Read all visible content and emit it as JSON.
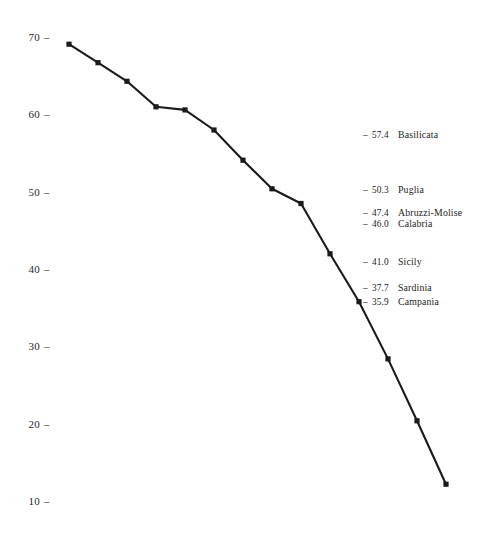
{
  "chart_data": {
    "type": "line",
    "title": "",
    "xlabel": "",
    "ylabel": "",
    "ylim": [
      10,
      70
    ],
    "xlim": [
      0,
      13
    ],
    "grid": false,
    "legend_position": "none",
    "y_ticks": [
      70,
      60,
      50,
      40,
      30,
      20,
      10
    ],
    "y_tick_labels": [
      "70",
      "60",
      "50",
      "40",
      "30",
      "20",
      "10"
    ],
    "x_ticks": [],
    "x_tick_labels": [],
    "marker": "square",
    "line_color": "#1a1a1a",
    "marker_color": "#1a1a1a",
    "x": [
      0,
      1,
      2,
      3,
      4,
      5,
      6,
      7,
      8,
      9,
      10,
      11,
      12,
      13
    ],
    "values": [
      69.2,
      66.8,
      64.4,
      61.1,
      60.7,
      58.1,
      54.2,
      50.5,
      48.6,
      42.1,
      35.9,
      28.5,
      20.5,
      12.3
    ],
    "series": [
      {
        "name": "regions",
        "values": [
          69.2,
          66.8,
          64.4,
          61.1,
          60.7,
          58.1,
          54.2,
          50.5,
          48.6,
          42.1,
          35.9,
          28.5,
          20.5,
          12.3
        ]
      }
    ],
    "points_px": [
      [
        69,
        40
      ],
      [
        103,
        59
      ],
      [
        132,
        77
      ],
      [
        165,
        103
      ],
      [
        196,
        107
      ],
      [
        228,
        127
      ],
      [
        258,
        158
      ],
      [
        292,
        187
      ],
      [
        320,
        202
      ],
      [
        348,
        252
      ],
      [
        380,
        362
      ],
      [
        409,
        362
      ],
      [
        414,
        424
      ],
      [
        446,
        488
      ]
    ],
    "annotations": [
      {
        "value": "57.4",
        "label": "Basilicata",
        "dash": "–"
      },
      {
        "value": "50.3",
        "label": "Puglia",
        "dash": "–"
      },
      {
        "value": "47.4",
        "label": "Abruzzi-Molise",
        "dash": "–"
      },
      {
        "value": "46.0",
        "label": "Calabria",
        "dash": "–"
      },
      {
        "value": "41.0",
        "label": "Sicily",
        "dash": "–"
      },
      {
        "value": "37.7",
        "label": "Sardinia",
        "dash": "–"
      },
      {
        "value": "35.9",
        "label": "Campania",
        "dash": "–"
      }
    ]
  },
  "axis": {
    "tick_dash": "–"
  },
  "colors": {
    "background": "#ffffff",
    "ink": "#1a1a1a"
  }
}
